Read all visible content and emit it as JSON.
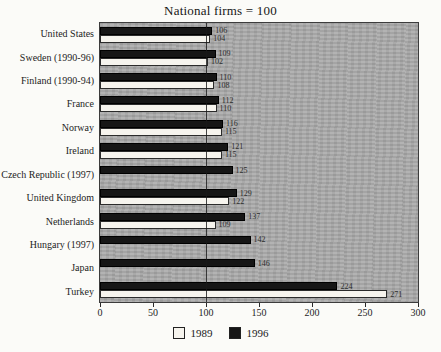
{
  "title": "National firms = 100",
  "chart_data": {
    "type": "bar",
    "orientation": "horizontal",
    "title": "National firms = 100",
    "categories": [
      "United States",
      "Sweden (1990-96)",
      "Finland (1990-94)",
      "France",
      "Norway",
      "Ireland",
      "Czech Republic (1997)",
      "United Kingdom",
      "Netherlands",
      "Hungary (1997)",
      "Japan",
      "Turkey"
    ],
    "series": [
      {
        "name": "1996",
        "color": "#161616",
        "values": [
          106,
          109,
          110,
          112,
          116,
          121,
          125,
          129,
          137,
          142,
          146,
          224
        ]
      },
      {
        "name": "1989",
        "color": "#f6f4ee",
        "values": [
          104,
          102,
          108,
          110,
          115,
          115,
          null,
          122,
          109,
          null,
          null,
          271
        ]
      }
    ],
    "xlim": [
      0,
      300
    ],
    "xticks": [
      0,
      50,
      100,
      150,
      200,
      250,
      300
    ],
    "reference_line": 100,
    "grid": false,
    "legend_position": "bottom",
    "legend": [
      {
        "label": "1989",
        "color": "#f6f4ee"
      },
      {
        "label": "1996",
        "color": "#161616"
      }
    ],
    "plot_background": "#a9a9a9"
  }
}
